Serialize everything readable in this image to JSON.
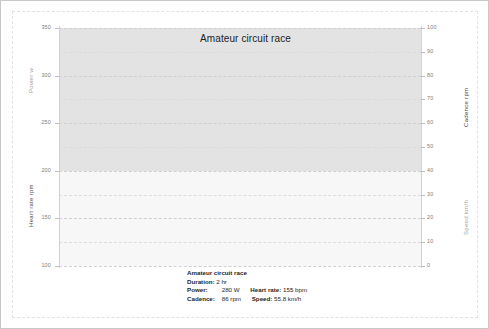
{
  "chart_data": {
    "type": "line",
    "title": "Amateur circuit race",
    "xlabel": "",
    "grid": true,
    "legend": "none",
    "axes": {
      "left": {
        "titles": [
          "Power w",
          "Heart rate rpm"
        ],
        "ticks": [
          350,
          300,
          250,
          200,
          150,
          100
        ],
        "lim": [
          100,
          350
        ]
      },
      "right": {
        "titles": [
          "Cadence rpm",
          "Speed km/h"
        ],
        "ticks": [
          100,
          90,
          80,
          70,
          60,
          50,
          40,
          30,
          20,
          10,
          0
        ],
        "lim": [
          0,
          100
        ]
      }
    },
    "x": [
      0,
      0.05,
      0.1,
      0.15,
      0.2,
      0.25,
      0.3,
      0.35,
      0.4,
      0.45,
      0.5,
      0.55,
      0.6,
      0.65,
      0.7,
      0.75,
      0.8,
      0.85,
      0.9,
      0.95,
      1.0
    ],
    "series": [
      {
        "name": "Power",
        "unit": "w",
        "axis": "left",
        "color": "#2b2b2b",
        "values": [
          313,
          314,
          315,
          316,
          318,
          319,
          317,
          316,
          318,
          319,
          320,
          320,
          319,
          319,
          321,
          323,
          322,
          318,
          314,
          314,
          318
        ]
      },
      {
        "name": "Cadence",
        "unit": "rpm",
        "axis": "right",
        "color": "#8c8c8c",
        "values": [
          71,
          69,
          66,
          64,
          65,
          68,
          71,
          74,
          76,
          73,
          69,
          68,
          69,
          68,
          66,
          64,
          67,
          71,
          71,
          74,
          80
        ]
      },
      {
        "name": "Heart rate",
        "unit": "rpm",
        "axis": "left",
        "color": "#6a6a6a",
        "values": [
          212,
          213,
          214,
          212,
          211,
          212,
          213,
          214,
          215,
          216,
          215,
          214,
          213,
          213,
          212,
          211,
          214,
          217,
          218,
          218,
          218
        ]
      },
      {
        "name": "Speed",
        "unit": "km/h",
        "axis": "right",
        "color": "#4f4f4f",
        "values": [
          33,
          32,
          31,
          31,
          32,
          32,
          33,
          34,
          35,
          34,
          33,
          33,
          33,
          33,
          32,
          31,
          32,
          34,
          34,
          34,
          35
        ]
      }
    ]
  },
  "summary": {
    "heading": "Amateur circuit race",
    "duration_label": "Duration:",
    "duration_value": "2 hr",
    "power_label": "Power:",
    "power_value": "280 W",
    "heart_rate_label": "Heart rate:",
    "heart_rate_value": "155 bpm",
    "cadence_label": "Cadence:",
    "cadence_value": "86 rpm",
    "speed_label": "Speed:",
    "speed_value": "55.8 km/h"
  },
  "colors": {
    "shade_band": "#e3e3e3",
    "plot_lower": "#f7f7f7",
    "gridline": "#cfcfcf",
    "frame": "#c8c8c8"
  }
}
